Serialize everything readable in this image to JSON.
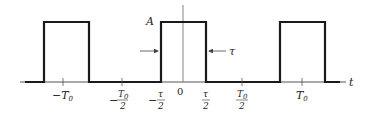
{
  "diagram": {
    "colors": {
      "signal": "#1a1a1a",
      "axis": "#555555",
      "text": "#222222"
    },
    "amplitude_label": "A",
    "width_label": "τ",
    "axis_label": "t",
    "origin_label": "0",
    "tick_labels": [
      {
        "id": "neg-T0",
        "sign": "−",
        "main": "T",
        "sub": "0"
      },
      {
        "id": "neg-T0-half",
        "sign": "−",
        "num": "T",
        "num_sub": "0",
        "den": "2"
      },
      {
        "id": "neg-tau-half",
        "sign": "−",
        "num": "τ",
        "den": "2"
      },
      {
        "id": "zero",
        "main": "0"
      },
      {
        "id": "tau-half",
        "num": "τ",
        "den": "2"
      },
      {
        "id": "T0-half",
        "num": "T",
        "num_sub": "0",
        "den": "2"
      },
      {
        "id": "T0",
        "main": "T",
        "sub": "0"
      }
    ],
    "pulses": [
      {
        "start": "-T0 - τ/2",
        "end": "-T0 + τ/2",
        "height": "A"
      },
      {
        "start": "-τ/2",
        "end": "τ/2",
        "height": "A"
      },
      {
        "start": "T0 - τ/2",
        "end": "T0 + τ/2",
        "height": "A"
      }
    ]
  }
}
